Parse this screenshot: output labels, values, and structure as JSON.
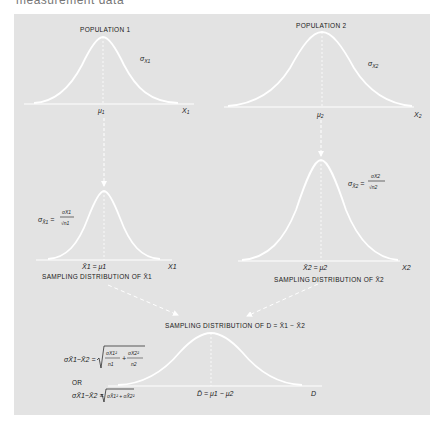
{
  "header": {
    "text": "measurement data"
  },
  "colors": {
    "panel": "#e3e3e3",
    "curve": "#ffffff",
    "text": "#1a1a1a"
  },
  "population1": {
    "title": "POPULATION 1",
    "sigma_label": "σ",
    "sigma_sub": "X1",
    "mean_label": "μ",
    "mean_sub": "1",
    "axis_label": "X",
    "axis_sub": "1"
  },
  "population2": {
    "title": "POPULATION 2",
    "sigma_label": "σ",
    "sigma_sub": "X2",
    "mean_label": "μ",
    "mean_sub": "2",
    "axis_label": "X",
    "axis_sub": "2"
  },
  "sampling1": {
    "formula_lhs": "σ",
    "formula_lhs_sub": "X̄1",
    "formula_num": "σX1",
    "formula_den": "√n1",
    "mean_label": "X̄1 = μ1",
    "axis_label": "X1",
    "caption": "SAMPLING DISTRIBUTION OF X̄1"
  },
  "sampling2": {
    "formula_lhs": "σ",
    "formula_lhs_sub": "X̄2",
    "formula_num": "σX2",
    "formula_den": "√n2",
    "mean_label": "X̄2 = μ2",
    "axis_label": "X2",
    "caption": "SAMPLING DISTRIBUTION OF X̄2"
  },
  "difference": {
    "caption": "SAMPLING DISTRIBUTION OF D = X̄1 − X̄2",
    "formula1": "σX̄1−X̄2 = √( σX1²/n1 + σX2²/n2 )",
    "formula1_lhs": "σX̄1−X̄2 =",
    "formula1_term1_num": "σX1²",
    "formula1_term1_den": "n1",
    "formula1_plus": "+",
    "formula1_term2_num": "σX2²",
    "formula1_term2_den": "n2",
    "or_label": "OR",
    "formula2": "σX̄1−X̄2 = √( σX̄1² + σX̄2² )",
    "formula2_lhs": "σX̄1−X̄2 =",
    "formula2_rhs": "σX̄1² + σX̄2²",
    "mean_label": "D̄ = μ1 − μ2",
    "axis_label": "D"
  }
}
